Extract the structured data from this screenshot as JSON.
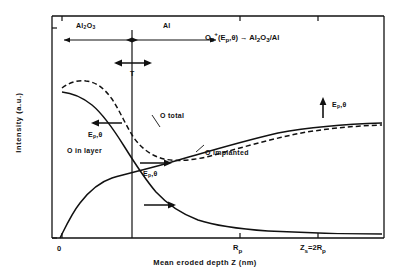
{
  "figure": {
    "caption_equation": "O2+(Ep,θ) → Al2O3/Al",
    "axes": {
      "ylabel": "Intensity  (a.u.)",
      "xlabel": "Mean eroded depth  Z  (nm)",
      "xticks": [
        "0",
        "Rp",
        "Zs=2Rp"
      ]
    },
    "region_labels": {
      "oxide": "Al2O3",
      "metal": "Al",
      "thickness": "T"
    },
    "curve_labels": {
      "total": "O total",
      "in_layer": "O in layer",
      "implanted": "O implanted"
    },
    "arrow_labels": {
      "left_arrow": "Ep,θ",
      "right_arrow": "Ep,θ",
      "up_arrow": "Ep,θ"
    }
  },
  "chart_data": {
    "type": "line",
    "title": "",
    "xlabel": "Mean eroded depth  Z  (nm)",
    "ylabel": "Intensity  (a.u.)",
    "xlim": [
      0,
      1.6
    ],
    "ylim": [
      0,
      1.0
    ],
    "grid": false,
    "legend": "inline-annotations",
    "xtick_values": [
      0,
      1.0,
      1.6
    ],
    "xtick_labels": [
      "0",
      "Rp",
      "Zs=2Rp"
    ],
    "interface_x": 0.36,
    "interface_label": "Al2O3 / Al boundary",
    "annotations": [
      {
        "text": "O2+(Ep,θ) → Al2O3/Al",
        "x": 0.78,
        "y": 0.95
      },
      {
        "text": "T",
        "x": 0.36,
        "y": 0.8,
        "desc": "oxide layer thickness, double arrow"
      },
      {
        "text": "Ep,θ",
        "x": 0.13,
        "y": 0.55,
        "desc": "left arrow: decreasing energy shifts curve left"
      },
      {
        "text": "Ep,θ",
        "x": 0.46,
        "y": 0.33,
        "desc": "right arrow on implanted curve"
      },
      {
        "text": "Ep,θ",
        "x": 1.33,
        "y": 0.7,
        "desc": "up arrow on plateau"
      }
    ],
    "series": [
      {
        "name": "O total",
        "style": "dashed",
        "x": [
          0.0,
          0.05,
          0.1,
          0.15,
          0.2,
          0.26,
          0.32,
          0.38,
          0.44,
          0.5,
          0.58,
          0.66,
          0.76,
          0.88,
          1.0,
          1.15,
          1.3,
          1.45,
          1.6
        ],
        "y": [
          0.74,
          0.8,
          0.81,
          0.805,
          0.79,
          0.75,
          0.66,
          0.55,
          0.45,
          0.38,
          0.33,
          0.31,
          0.315,
          0.33,
          0.36,
          0.4,
          0.44,
          0.46,
          0.47
        ]
      },
      {
        "name": "O in layer",
        "style": "solid",
        "x": [
          0.0,
          0.05,
          0.12,
          0.2,
          0.28,
          0.36,
          0.44,
          0.52,
          0.6,
          0.7,
          0.8,
          0.92,
          1.05,
          1.2,
          1.4,
          1.6
        ],
        "y": [
          0.72,
          0.715,
          0.69,
          0.63,
          0.54,
          0.42,
          0.3,
          0.21,
          0.145,
          0.095,
          0.065,
          0.045,
          0.035,
          0.028,
          0.024,
          0.022
        ]
      },
      {
        "name": "O implanted",
        "style": "solid",
        "x": [
          0.0,
          0.06,
          0.12,
          0.18,
          0.24,
          0.3,
          0.36,
          0.42,
          0.5,
          0.6,
          0.72,
          0.86,
          1.0,
          1.18,
          1.36,
          1.6
        ],
        "y": [
          0.0,
          0.035,
          0.085,
          0.135,
          0.175,
          0.205,
          0.225,
          0.245,
          0.275,
          0.315,
          0.355,
          0.395,
          0.425,
          0.45,
          0.465,
          0.472
        ]
      }
    ]
  }
}
